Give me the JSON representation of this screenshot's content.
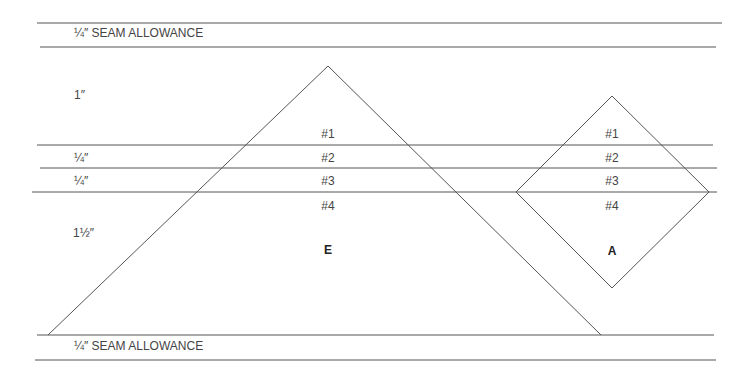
{
  "diagram": {
    "type": "quilt-foundation-template",
    "colors": {
      "line": "#555555",
      "text": "#444444",
      "background": "#ffffff"
    },
    "seam_allowance_top": {
      "label": "¼″  SEAM ALLOWANCE"
    },
    "seam_allowance_bottom": {
      "label": "¼″  SEAM ALLOWANCE"
    },
    "row_measurements": [
      {
        "label": "1″"
      },
      {
        "label": "¼″"
      },
      {
        "label": "¼″"
      },
      {
        "label": "1½″"
      }
    ],
    "pieces": [
      {
        "name": "E",
        "shape": "triangle",
        "sections": [
          "#1",
          "#2",
          "#3",
          "#4"
        ]
      },
      {
        "name": "A",
        "shape": "diamond",
        "sections": [
          "#1",
          "#2",
          "#3",
          "#4"
        ]
      }
    ]
  }
}
